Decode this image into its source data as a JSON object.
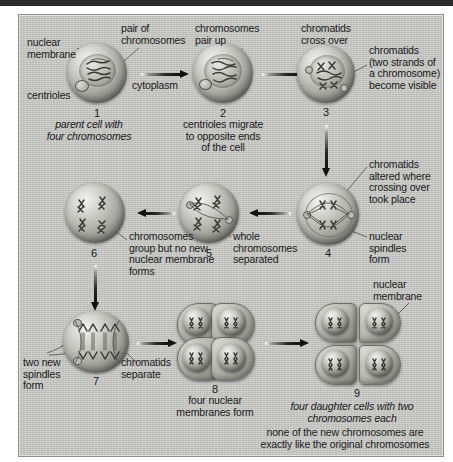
{
  "figure": {
    "background_color": "#c9c9c6",
    "ink_color": "#1a1a1a"
  },
  "stages": [
    {
      "number": "1",
      "caption": "parent cell with\nfour chromosomes",
      "labels": [
        "nuclear\nmembrane",
        "pair of\nchromosomes",
        "centrioles",
        "cytoplasm"
      ]
    },
    {
      "number": "2",
      "caption": "centrioles migrate\nto opposite ends\nof the cell",
      "labels": [
        "chromosomes\npair up"
      ]
    },
    {
      "number": "3",
      "caption": "",
      "labels": [
        "chromatids\ncross over",
        "chromatids\n(two strands of\na chromosome)\nbecome visible"
      ]
    },
    {
      "number": "4",
      "caption": "",
      "labels": [
        "chromatids\naltered where\ncrossing over\ntook place",
        "nuclear\nspindles\nform"
      ]
    },
    {
      "number": "5",
      "caption": "",
      "labels": [
        "whole\nchromosomes\nseparated"
      ]
    },
    {
      "number": "6",
      "caption": "",
      "labels": [
        "chromosomes\ngroup but no new\nnuclear membrane\nforms"
      ]
    },
    {
      "number": "7",
      "caption": "",
      "labels": [
        "two new\nspindles\nform",
        "chromatids\nseparate"
      ]
    },
    {
      "number": "8",
      "caption": "four nuclear\nmembranes form",
      "labels": []
    },
    {
      "number": "9",
      "caption": "four daughter cells with two\nchromosomes each",
      "note": "none of the new chromosomes are\nexactly like the original chromosomes",
      "labels": [
        "nuclear\nmembrane"
      ]
    }
  ],
  "text": {
    "nuclear_membrane_1": "nuclear\nmembrane",
    "pair_of_chromosomes": "pair of\nchromosomes",
    "centrioles": "centrioles",
    "cytoplasm": "cytoplasm",
    "num_1": "1",
    "caption_1": "parent cell with\nfour chromosomes",
    "chromosomes_pair_up": "chromosomes\npair up",
    "num_2": "2",
    "caption_2": "centrioles migrate\nto opposite ends\nof the cell",
    "chromatids_cross_over": "chromatids\ncross over",
    "num_3": "3",
    "chromatids_two_strands": "chromatids\n(two strands of\na chromosome)\nbecome visible",
    "chromatids_altered": "chromatids\naltered where\ncrossing over\ntook place",
    "num_4": "4",
    "nuclear_spindles_form": "nuclear\nspindles\nform",
    "whole_chromosomes_separated": "whole\nchromosomes\nseparated",
    "num_5": "5",
    "chromosomes_group": "chromosomes\ngroup but no new\nnuclear membrane\nforms",
    "num_6": "6",
    "two_new_spindles_form": "two new\nspindles\nform",
    "num_7": "7",
    "chromatids_separate": "chromatids\nseparate",
    "num_8": "8",
    "caption_8": "four nuclear\nmembranes form",
    "nuclear_membrane_9": "nuclear\nmembrane",
    "num_9": "9",
    "caption_9": "four daughter cells with two\nchromosomes each",
    "note_9": "none of the new chromosomes are\nexactly like the original chromosomes"
  }
}
